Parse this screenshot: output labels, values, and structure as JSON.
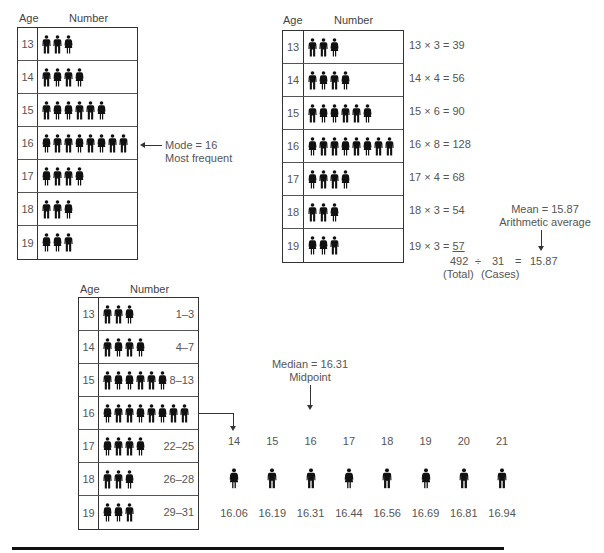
{
  "headers": {
    "age": "Age",
    "number": "Number"
  },
  "mode_table": {
    "rows": [
      {
        "age": "13",
        "figures": [
          "m",
          "m",
          "w"
        ]
      },
      {
        "age": "14",
        "figures": [
          "m",
          "w",
          "m",
          "w"
        ]
      },
      {
        "age": "15",
        "figures": [
          "m",
          "w",
          "w",
          "m",
          "m",
          "w"
        ]
      },
      {
        "age": "16",
        "figures": [
          "w",
          "m",
          "m",
          "w",
          "m",
          "w",
          "m",
          "m"
        ]
      },
      {
        "age": "17",
        "figures": [
          "w",
          "m",
          "m",
          "w"
        ]
      },
      {
        "age": "18",
        "figures": [
          "m",
          "m",
          "w"
        ]
      },
      {
        "age": "19",
        "figures": [
          "w",
          "w",
          "m"
        ]
      }
    ],
    "annotation_line1": "Mode = 16",
    "annotation_line2": "Most frequent"
  },
  "mean_table": {
    "rows": [
      {
        "age": "13",
        "figures": [
          "m",
          "m",
          "w"
        ],
        "calc": "13 × 3 = 39"
      },
      {
        "age": "14",
        "figures": [
          "m",
          "w",
          "m",
          "w"
        ],
        "calc": "14 × 4 = 56"
      },
      {
        "age": "15",
        "figures": [
          "m",
          "w",
          "w",
          "m",
          "m",
          "w"
        ],
        "calc": "15 × 6 = 90"
      },
      {
        "age": "16",
        "figures": [
          "w",
          "m",
          "m",
          "w",
          "m",
          "w",
          "m",
          "m"
        ],
        "calc": "16 × 8 = 128"
      },
      {
        "age": "17",
        "figures": [
          "w",
          "m",
          "m",
          "w"
        ],
        "calc": "17 × 4 = 68"
      },
      {
        "age": "18",
        "figures": [
          "m",
          "m",
          "w"
        ],
        "calc": "18 × 3 = 54"
      },
      {
        "age": "19",
        "figures": [
          "w",
          "w",
          "m"
        ],
        "calc_prefix": "19 × 3 = ",
        "calc_underlined": "57"
      }
    ],
    "total": "492",
    "divide": "÷",
    "cases": "31",
    "equals": "=",
    "result": "15.87",
    "total_label": "(Total)",
    "cases_label": "(Cases)",
    "annotation_line1": "Mean = 15.87",
    "annotation_line2": "Arithmetic average"
  },
  "median_table": {
    "rows": [
      {
        "age": "13",
        "figures": [
          "m",
          "m",
          "w"
        ],
        "range": "1–3"
      },
      {
        "age": "14",
        "figures": [
          "m",
          "w",
          "m",
          "w"
        ],
        "range": "4–7"
      },
      {
        "age": "15",
        "figures": [
          "m",
          "w",
          "w",
          "m",
          "m",
          "w"
        ],
        "range": "8–13"
      },
      {
        "age": "16",
        "figures": [
          "w",
          "m",
          "m",
          "w",
          "m",
          "w",
          "m",
          "m"
        ],
        "range": ""
      },
      {
        "age": "17",
        "figures": [
          "w",
          "m",
          "m",
          "w"
        ],
        "range": "22–25"
      },
      {
        "age": "18",
        "figures": [
          "m",
          "m",
          "w"
        ],
        "range": "26–28"
      },
      {
        "age": "19",
        "figures": [
          "w",
          "w",
          "m"
        ],
        "range": "29–31"
      }
    ],
    "annotation_line1": "Median = 16.31",
    "annotation_line2": "Midpoint",
    "expansion": [
      {
        "case": "14",
        "figure": "w",
        "value": "16.06"
      },
      {
        "case": "15",
        "figure": "m",
        "value": "16.19"
      },
      {
        "case": "16",
        "figure": "m",
        "value": "16.31"
      },
      {
        "case": "17",
        "figure": "w",
        "value": "16.44"
      },
      {
        "case": "18",
        "figure": "m",
        "value": "16.56"
      },
      {
        "case": "19",
        "figure": "w",
        "value": "16.69"
      },
      {
        "case": "20",
        "figure": "m",
        "value": "16.81"
      },
      {
        "case": "21",
        "figure": "m",
        "value": "16.94"
      }
    ]
  }
}
